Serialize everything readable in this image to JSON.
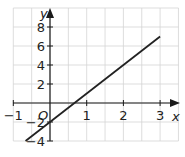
{
  "chart_data": {
    "type": "line",
    "title": "",
    "xlabel": "x",
    "ylabel": "y",
    "origin_label": "O",
    "xlim": [
      -1,
      3.5
    ],
    "ylim": [
      -4,
      10
    ],
    "grid": true,
    "x_ticks": [
      -1,
      1,
      2,
      3
    ],
    "y_ticks": [
      8,
      6,
      4,
      2,
      -2,
      -4
    ],
    "x_tick_labels": [
      "−1",
      "1",
      "2",
      "3"
    ],
    "y_tick_labels": [
      "8",
      "6",
      "4",
      "2",
      "−2",
      "−4"
    ],
    "series": [
      {
        "name": "y = 3x − 2",
        "x": [
          -0.667,
          3
        ],
        "y": [
          -4,
          7
        ],
        "color": "#222222"
      }
    ]
  }
}
